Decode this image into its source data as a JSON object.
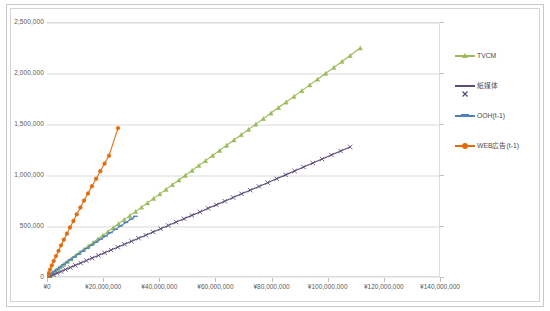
{
  "chart_data": {
    "type": "scatter",
    "title": "",
    "subtitle": "",
    "xlabel": "",
    "ylabel": "",
    "xlim": [
      0,
      140000000
    ],
    "ylim": [
      0,
      2500000
    ],
    "grid": true,
    "grid_axis": "y",
    "legend_position": "right",
    "x_ticks": [
      0,
      20000000,
      40000000,
      60000000,
      80000000,
      100000000,
      120000000,
      140000000
    ],
    "x_tick_labels": [
      "¥0",
      "¥20,000,000",
      "¥40,000,000",
      "¥60,000,000",
      "¥80,000,000",
      "¥100,000,000",
      "¥120,000,000",
      "¥140,000,000"
    ],
    "y_ticks": [
      0,
      500000,
      1000000,
      1500000,
      2000000,
      2500000
    ],
    "y_tick_labels": [
      "0",
      "500,000",
      "1,000,000",
      "1,500,000",
      "2,000,000",
      "2,500,000"
    ],
    "series": [
      {
        "name": "TVCM",
        "color": "#9bbb59",
        "marker": "triangle",
        "points": [
          [
            300000,
            9000
          ],
          [
            900000,
            24000
          ],
          [
            1700000,
            42000
          ],
          [
            2600000,
            62000
          ],
          [
            3600000,
            84000
          ],
          [
            4700000,
            108000
          ],
          [
            5900000,
            133000
          ],
          [
            7200000,
            160000
          ],
          [
            8600000,
            188000
          ],
          [
            10000000,
            218000
          ],
          [
            11500000,
            248000
          ],
          [
            13100000,
            280000
          ],
          [
            14700000,
            313000
          ],
          [
            16400000,
            347000
          ],
          [
            18100000,
            382000
          ],
          [
            19900000,
            418000
          ],
          [
            21700000,
            455000
          ],
          [
            23600000,
            493000
          ],
          [
            25500000,
            532000
          ],
          [
            27500000,
            572000
          ],
          [
            29500000,
            612000
          ],
          [
            31600000,
            653000
          ],
          [
            33700000,
            695000
          ],
          [
            35800000,
            737000
          ],
          [
            38000000,
            781000
          ],
          [
            40200000,
            825000
          ],
          [
            42400000,
            869000
          ],
          [
            44700000,
            915000
          ],
          [
            47000000,
            961000
          ],
          [
            49300000,
            1007000
          ],
          [
            51700000,
            1055000
          ],
          [
            54100000,
            1103000
          ],
          [
            56500000,
            1151000
          ],
          [
            59000000,
            1201000
          ],
          [
            61500000,
            1251000
          ],
          [
            64000000,
            1301000
          ],
          [
            66600000,
            1353000
          ],
          [
            69200000,
            1405000
          ],
          [
            71800000,
            1457000
          ],
          [
            74400000,
            1509000
          ],
          [
            77100000,
            1563000
          ],
          [
            79800000,
            1617000
          ],
          [
            82500000,
            1671000
          ],
          [
            85200000,
            1725000
          ],
          [
            88000000,
            1781000
          ],
          [
            90800000,
            1837000
          ],
          [
            93600000,
            1893000
          ],
          [
            96400000,
            1949000
          ],
          [
            99300000,
            2007000
          ],
          [
            102200000,
            2065000
          ],
          [
            105100000,
            2123000
          ],
          [
            108000000,
            2181000
          ],
          [
            111600000,
            2255000
          ]
        ]
      },
      {
        "name": "紙媒体",
        "color": "#5a4a7a",
        "marker": "x",
        "points": [
          [
            400000,
            6000
          ],
          [
            1200000,
            17000
          ],
          [
            2300000,
            31000
          ],
          [
            3600000,
            47000
          ],
          [
            5000000,
            64000
          ],
          [
            6600000,
            83000
          ],
          [
            8300000,
            103000
          ],
          [
            10100000,
            124000
          ],
          [
            12000000,
            147000
          ],
          [
            14000000,
            171000
          ],
          [
            16100000,
            195000
          ],
          [
            18300000,
            221000
          ],
          [
            20500000,
            247000
          ],
          [
            22800000,
            274000
          ],
          [
            25200000,
            302000
          ],
          [
            27600000,
            331000
          ],
          [
            30100000,
            360000
          ],
          [
            32600000,
            390000
          ],
          [
            35200000,
            420000
          ],
          [
            37800000,
            451000
          ],
          [
            40500000,
            483000
          ],
          [
            43200000,
            515000
          ],
          [
            46000000,
            548000
          ],
          [
            48800000,
            581000
          ],
          [
            51600000,
            614000
          ],
          [
            54500000,
            648000
          ],
          [
            57400000,
            683000
          ],
          [
            60300000,
            717000
          ],
          [
            63300000,
            753000
          ],
          [
            66300000,
            789000
          ],
          [
            69300000,
            825000
          ],
          [
            72400000,
            861000
          ],
          [
            75500000,
            898000
          ],
          [
            78600000,
            935000
          ],
          [
            81800000,
            973000
          ],
          [
            85000000,
            1011000
          ],
          [
            88200000,
            1049000
          ],
          [
            91400000,
            1088000
          ],
          [
            94700000,
            1127000
          ],
          [
            98000000,
            1166000
          ],
          [
            101300000,
            1206000
          ],
          [
            104600000,
            1245000
          ],
          [
            108000000,
            1285000
          ]
        ]
      },
      {
        "name": "OOH(t-1)",
        "color": "#4f81bd",
        "marker": "dash",
        "points": [
          [
            300000,
            10000
          ],
          [
            900000,
            26000
          ],
          [
            1700000,
            44000
          ],
          [
            2600000,
            64000
          ],
          [
            3600000,
            85000
          ],
          [
            4700000,
            107000
          ],
          [
            5900000,
            131000
          ],
          [
            7100000,
            155000
          ],
          [
            8400000,
            181000
          ],
          [
            9800000,
            207000
          ],
          [
            11200000,
            234000
          ],
          [
            12700000,
            262000
          ],
          [
            14200000,
            290000
          ],
          [
            15800000,
            320000
          ],
          [
            17400000,
            350000
          ],
          [
            19100000,
            381000
          ],
          [
            20800000,
            412000
          ],
          [
            22600000,
            444000
          ],
          [
            24400000,
            477000
          ],
          [
            26200000,
            510000
          ],
          [
            28100000,
            544000
          ],
          [
            30000000,
            578000
          ],
          [
            31500000,
            605000
          ]
        ]
      },
      {
        "name": "WEB広告(t-1)",
        "color": "#e36c0a",
        "marker": "circle",
        "points": [
          [
            200000,
            17000
          ],
          [
            600000,
            47000
          ],
          [
            1100000,
            83000
          ],
          [
            1700000,
            123000
          ],
          [
            2400000,
            167000
          ],
          [
            3200000,
            215000
          ],
          [
            4100000,
            266000
          ],
          [
            5000000,
            320000
          ],
          [
            6000000,
            376000
          ],
          [
            7100000,
            435000
          ],
          [
            8200000,
            496000
          ],
          [
            9400000,
            559000
          ],
          [
            10600000,
            624000
          ],
          [
            11900000,
            691000
          ],
          [
            13200000,
            759000
          ],
          [
            14600000,
            829000
          ],
          [
            16000000,
            900000
          ],
          [
            17500000,
            973000
          ],
          [
            19000000,
            1047000
          ],
          [
            20500000,
            1122000
          ],
          [
            22100000,
            1199000
          ],
          [
            25300000,
            1470000
          ]
        ]
      }
    ]
  },
  "legend": {
    "items": [
      {
        "label": "TVCM",
        "color": "#9bbb59",
        "marker": "triangle"
      },
      {
        "label": "紙媒体",
        "color": "#5a4a7a",
        "marker": "x"
      },
      {
        "label": "OOH(t-1)",
        "color": "#4f81bd",
        "marker": "dash"
      },
      {
        "label": "WEB広告(t-1)",
        "color": "#e36c0a",
        "marker": "circle"
      }
    ]
  }
}
